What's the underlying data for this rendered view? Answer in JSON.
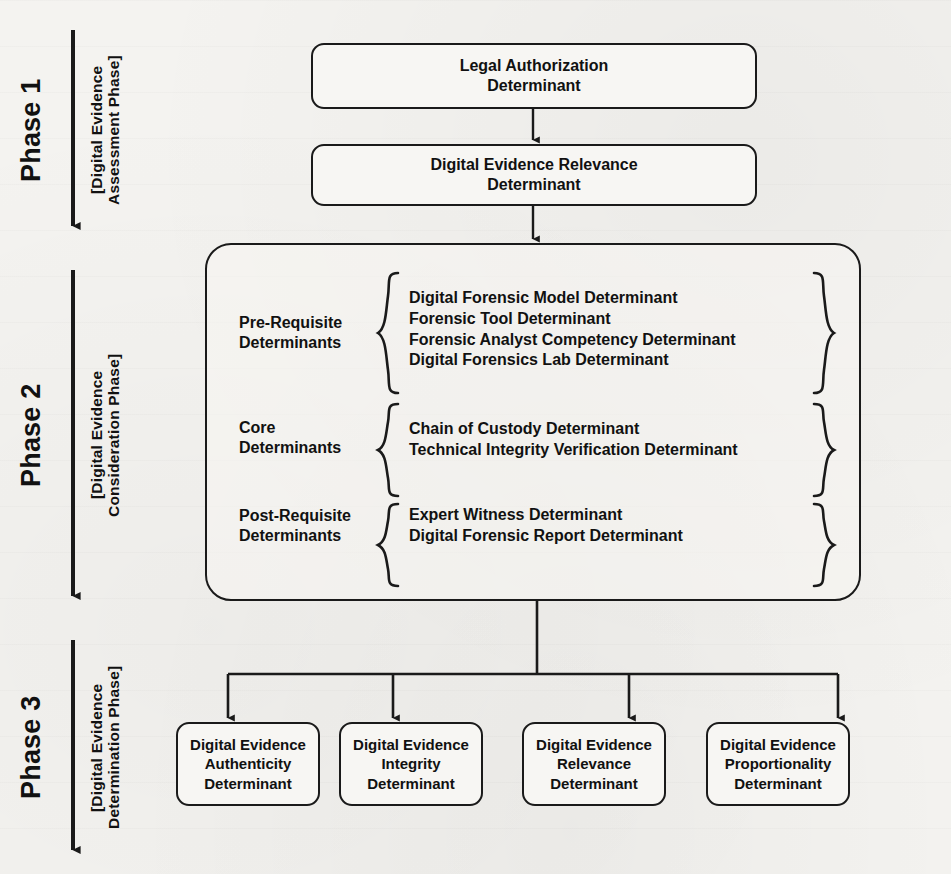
{
  "diagram": {
    "colors": {
      "stroke": "#1a1a1a",
      "text": "#111111",
      "paper": "#f4f3f0",
      "box_fill": "#f7f6f3"
    },
    "phases": [
      {
        "id": "phase-1",
        "title": "Phase 1",
        "subtitle_line1": "[Digital Evidence",
        "subtitle_line2": "Assessment Phase]",
        "arrow": "down-arrow"
      },
      {
        "id": "phase-2",
        "title": "Phase 2",
        "subtitle_line1": "[Digital Evidence",
        "subtitle_line2": "Consideration Phase]",
        "arrow": "down-arrow"
      },
      {
        "id": "phase-3",
        "title": "Phase 3",
        "subtitle_line1": "[Digital Evidence",
        "subtitle_line2": "Determination Phase]",
        "arrow": "down-arrow"
      }
    ],
    "phase1_nodes": [
      {
        "id": "legal-authorization",
        "line1": "Legal Authorization",
        "line2": "Determinant"
      },
      {
        "id": "digital-evidence-relevance",
        "line1": "Digital Evidence Relevance",
        "line2": "Determinant"
      }
    ],
    "phase2_groups": [
      {
        "id": "pre-requisite",
        "label_line1": "Pre-Requisite",
        "label_line2": "Determinants",
        "items": [
          "Digital Forensic Model Determinant",
          "Forensic Tool Determinant",
          "Forensic Analyst Competency Determinant",
          "Digital Forensics Lab Determinant"
        ]
      },
      {
        "id": "core",
        "label_line1": "Core",
        "label_line2": "Determinants",
        "items": [
          "Chain of Custody Determinant",
          "Technical Integrity Verification Determinant"
        ]
      },
      {
        "id": "post-requisite",
        "label_line1": "Post-Requisite",
        "label_line2": "Determinants",
        "items": [
          "Expert Witness Determinant",
          "Digital Forensic Report Determinant"
        ]
      }
    ],
    "phase3_nodes": [
      {
        "id": "authenticity",
        "line1": "Digital Evidence",
        "line2": "Authenticity",
        "line3": "Determinant"
      },
      {
        "id": "integrity",
        "line1": "Digital Evidence",
        "line2": "Integrity",
        "line3": "Determinant"
      },
      {
        "id": "relevance",
        "line1": "Digital Evidence",
        "line2": "Relevance",
        "line3": "Determinant"
      },
      {
        "id": "proportionality",
        "line1": "Digital Evidence",
        "line2": "Proportionality",
        "line3": "Determinant"
      }
    ]
  }
}
